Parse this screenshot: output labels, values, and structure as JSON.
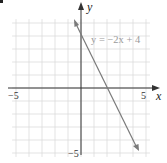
{
  "chart_data": {
    "type": "line",
    "title": "",
    "xlabel": "x",
    "ylabel": "y",
    "xlim": [
      -5.5,
      5.5
    ],
    "ylim": [
      -5.5,
      5.5
    ],
    "grid": true,
    "x_ticks_labeled": [
      "-5",
      "5"
    ],
    "y_ticks_labeled": [
      "-5"
    ],
    "series": [
      {
        "name": "y = -2x + 4",
        "equation": "y = -2x + 4",
        "slope": -2,
        "intercept": 4,
        "x": [
          0.5,
          4.5
        ],
        "y": [
          5,
          -5
        ]
      }
    ],
    "annotations": [
      {
        "text": "y = −2x + 4",
        "x": 2.2,
        "y": 3.7
      }
    ]
  },
  "labels": {
    "x_axis": "x",
    "y_axis": "y",
    "x_min": "−5",
    "x_max": "5",
    "y_min": "−5",
    "equation": "y = −2x + 4"
  },
  "colors": {
    "grid": "#dcdcdc",
    "axis": "#333333",
    "line": "#7a7a7a",
    "equation_text": "#9a9a9a"
  }
}
